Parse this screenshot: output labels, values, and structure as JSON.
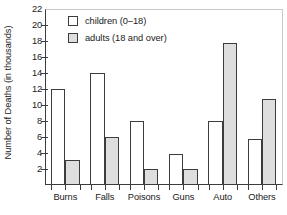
{
  "chart_data": {
    "type": "bar",
    "title": "",
    "xlabel": "",
    "ylabel": "Number of Deaths (in thousands)",
    "categories": [
      "Burns",
      "Falls",
      "Poisons",
      "Guns",
      "Auto",
      "Others"
    ],
    "series": [
      {
        "name": "children (0–18)",
        "fill": "#ffffff",
        "values": [
          12,
          14,
          8,
          3.8,
          8,
          5.7
        ]
      },
      {
        "name": "adults (18 and over)",
        "fill": "#dedede",
        "values": [
          3.1,
          6,
          2,
          1.9,
          17.8,
          10.7
        ]
      }
    ],
    "ylim": [
      0,
      22
    ],
    "yticks": [
      2,
      4,
      6,
      8,
      10,
      12,
      14,
      16,
      18,
      20,
      22
    ],
    "ytick_labels": [
      "2",
      "4",
      "6",
      "8",
      "10",
      "12",
      "14",
      "16",
      "18",
      "20",
      "22"
    ],
    "grid": false,
    "legend_position": "top-left",
    "legend": [
      {
        "label": "children (0–18)",
        "swatch": "white"
      },
      {
        "label": "adults (18 and over)",
        "swatch": "gray"
      }
    ]
  }
}
